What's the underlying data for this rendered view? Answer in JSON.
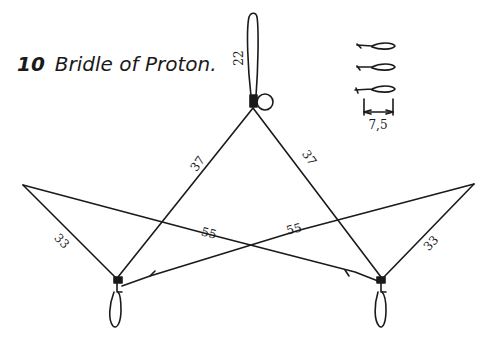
{
  "figure": {
    "number": "10",
    "title": "Bridle of Proton."
  },
  "labels": {
    "tow_loop": "22",
    "upper_left": "37",
    "upper_right": "37",
    "cross_left": "55",
    "cross_right": "55",
    "outer_left": "33",
    "outer_right": "33",
    "knot_dimension": "7,5"
  },
  "colors": {
    "line": "#1a1a1a",
    "background": "#ffffff"
  }
}
